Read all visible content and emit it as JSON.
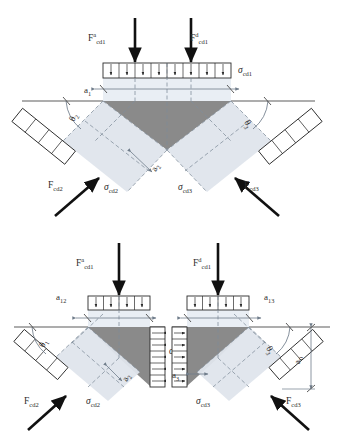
{
  "figure": {
    "type": "engineering-diagram",
    "background_color": "#ffffff",
    "line_color": "#3a3a3a",
    "dash_color": "#7f8c99",
    "strut_fill": "#dfe5ec",
    "wedge_fill_dark": "#8a8a8a",
    "wedge_fill_mid": "#b5b5b5",
    "arrow_color": "#111111"
  },
  "diagrams": [
    {
      "id": "top",
      "name": "combined-node",
      "forces": [
        {
          "name": "force-left-top",
          "base": "F",
          "sub": "cd1",
          "sup": "a",
          "direction": "down"
        },
        {
          "name": "force-right-top",
          "base": "F",
          "sub": "cd1",
          "sup": "d",
          "direction": "down"
        },
        {
          "name": "force-lower-left",
          "base": "F",
          "sub": "cd2",
          "sup": "",
          "direction": "up-right"
        },
        {
          "name": "force-lower-right",
          "base": "F",
          "sub": "cd3",
          "sup": "",
          "direction": "up-left"
        }
      ],
      "stresses": [
        {
          "name": "stress-top",
          "base": "σ",
          "sub": "cd1",
          "cells": 8,
          "orientation": "horizontal"
        },
        {
          "name": "stress-left",
          "base": "σ",
          "sub": "cd2",
          "cells": 4,
          "orientation": "diagonal"
        },
        {
          "name": "stress-right",
          "base": "σ",
          "sub": "cd3",
          "cells": 4,
          "orientation": "diagonal"
        }
      ],
      "dimensions": [
        {
          "name": "dim-a1",
          "base": "a",
          "sub": "1"
        },
        {
          "name": "dim-a2",
          "base": "a",
          "sub": "2"
        }
      ],
      "angles": [
        {
          "name": "angle-theta2",
          "base": "θ",
          "sub": "2"
        },
        {
          "name": "angle-theta3",
          "base": "θ",
          "sub": "3"
        }
      ]
    },
    {
      "id": "bottom-left",
      "name": "left-sub-node",
      "forces": [
        {
          "name": "force-top",
          "base": "F",
          "sub": "cd1",
          "sup": "a",
          "direction": "down"
        },
        {
          "name": "force-diagonal",
          "base": "F",
          "sub": "cd2",
          "sup": "",
          "direction": "up-right"
        }
      ],
      "stresses": [
        {
          "name": "stress-top",
          "base": "σ",
          "sub": "cd1",
          "cells": 4,
          "orientation": "horizontal"
        },
        {
          "name": "stress-diagonal",
          "base": "σ",
          "sub": "cd2",
          "cells": 4,
          "orientation": "diagonal"
        },
        {
          "name": "stress-interface",
          "base": "σ",
          "sub": "cd0",
          "cells": 5,
          "orientation": "vertical"
        }
      ],
      "dimensions": [
        {
          "name": "dim-a12",
          "base": "a",
          "sub": "12"
        },
        {
          "name": "dim-a2",
          "base": "a",
          "sub": "2"
        }
      ],
      "angles": [
        {
          "name": "angle-theta1",
          "base": "θ",
          "sub": "1"
        }
      ]
    },
    {
      "id": "bottom-right",
      "name": "right-sub-node",
      "forces": [
        {
          "name": "force-top",
          "base": "F",
          "sub": "cd1",
          "sup": "d",
          "direction": "down"
        },
        {
          "name": "force-diagonal",
          "base": "F",
          "sub": "cd3",
          "sup": "",
          "direction": "up-left"
        }
      ],
      "stresses": [
        {
          "name": "stress-top",
          "base": "σ",
          "sub": "cd1",
          "cells": 4,
          "orientation": "horizontal"
        },
        {
          "name": "stress-diagonal",
          "base": "σ",
          "sub": "cd3",
          "cells": 4,
          "orientation": "diagonal"
        },
        {
          "name": "stress-interface",
          "base": "σ",
          "sub": "cd0",
          "cells": 5,
          "orientation": "vertical"
        }
      ],
      "dimensions": [
        {
          "name": "dim-a13",
          "base": "a",
          "sub": "13"
        },
        {
          "name": "dim-a3",
          "base": "a",
          "sub": "3"
        },
        {
          "name": "dim-a0",
          "base": "a",
          "sub": "0"
        }
      ],
      "angles": [
        {
          "name": "angle-theta3",
          "base": "θ",
          "sub": "3"
        }
      ]
    }
  ],
  "labels": {
    "top": {
      "F_left": {
        "base": "F",
        "sup": "a",
        "sub": "cd1"
      },
      "F_right": {
        "base": "F",
        "sup": "d",
        "sub": "cd1"
      },
      "F_lleft": {
        "base": "F",
        "sup": "",
        "sub": "cd2"
      },
      "F_lright": {
        "base": "F",
        "sup": "",
        "sub": "cd3"
      },
      "sigma_top": {
        "base": "σ",
        "sub": "cd1"
      },
      "sigma_left": {
        "base": "σ",
        "sub": "cd2"
      },
      "sigma_right": {
        "base": "σ",
        "sub": "cd3"
      },
      "a1": {
        "base": "a",
        "sub": "1"
      },
      "a2": {
        "base": "a",
        "sub": "2"
      },
      "theta2": {
        "base": "θ",
        "sub": "2"
      },
      "theta3": {
        "base": "θ",
        "sub": "3"
      }
    },
    "bl": {
      "F_top": {
        "base": "F",
        "sup": "a",
        "sub": "cd1"
      },
      "F_diag": {
        "base": "F",
        "sup": "",
        "sub": "cd2"
      },
      "sigma_diag": {
        "base": "σ",
        "sub": "cd2"
      },
      "sigma_int": {
        "base": "σ",
        "sub": "cd0"
      },
      "a12": {
        "base": "a",
        "sub": "12"
      },
      "a2": {
        "base": "a",
        "sub": "2"
      },
      "theta1": {
        "base": "θ",
        "sub": "1"
      }
    },
    "br": {
      "F_top": {
        "base": "F",
        "sup": "d",
        "sub": "cd1"
      },
      "F_diag": {
        "base": "F",
        "sup": "",
        "sub": "cd3"
      },
      "sigma_diag": {
        "base": "σ",
        "sub": "cd3"
      },
      "a13": {
        "base": "a",
        "sub": "13"
      },
      "a3": {
        "base": "a",
        "sub": "3"
      },
      "a0": {
        "base": "a",
        "sub": "0"
      },
      "theta3": {
        "base": "θ",
        "sub": "3"
      }
    }
  }
}
